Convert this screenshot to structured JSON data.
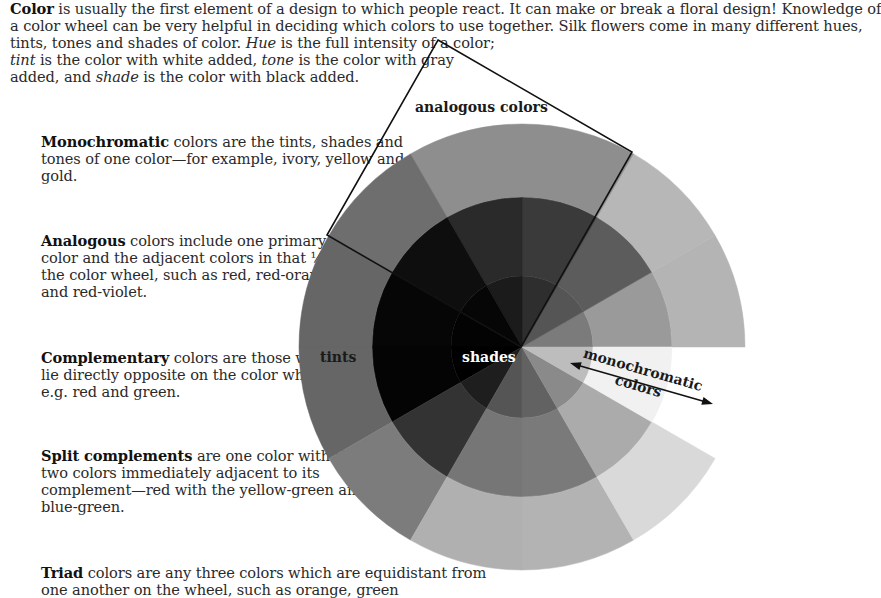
{
  "intro": {
    "lines": [
      [
        {
          "t": "Color",
          "s": "b"
        },
        {
          "t": " is usually the first element of a design to which people react. It can make or break a floral design! Knowledge of"
        }
      ],
      [
        {
          "t": "a color wheel can be very helpful in deciding which colors to use together. Silk flowers come in many different hues,"
        }
      ],
      [
        {
          "t": "tints, tones and shades of color. "
        },
        {
          "t": "Hue",
          "s": "i"
        },
        {
          "t": " is the full intensity of a color;"
        }
      ],
      [
        {
          "t": "tint",
          "s": "i"
        },
        {
          "t": " is the color with white added, "
        },
        {
          "t": "tone",
          "s": "i"
        },
        {
          "t": " is the color with gray"
        }
      ],
      [
        {
          "t": "added, and "
        },
        {
          "t": "shade",
          "s": "i"
        },
        {
          "t": " is the color with black added."
        }
      ]
    ]
  },
  "blocks": [
    {
      "id": "monochromatic",
      "top": 133,
      "lines": [
        [
          {
            "t": "Monochromatic",
            "s": "b"
          },
          {
            "t": " colors are the tints, shades and"
          }
        ],
        [
          {
            "t": "tones of one color—for example, ivory, yellow and"
          }
        ],
        [
          {
            "t": "gold."
          }
        ]
      ]
    },
    {
      "id": "analogous",
      "top": 232,
      "lines": [
        [
          {
            "t": "Analogous",
            "s": "b"
          },
          {
            "t": " colors include one primary"
          }
        ],
        [
          {
            "t": "color and the adjacent colors in that ¼ of"
          }
        ],
        [
          {
            "t": "the color wheel, such as red, red-orange"
          }
        ],
        [
          {
            "t": "and red-violet."
          }
        ]
      ]
    },
    {
      "id": "complementary",
      "top": 349,
      "lines": [
        [
          {
            "t": "Complementary",
            "s": "b"
          },
          {
            "t": " colors are those which"
          }
        ],
        [
          {
            "t": "lie directly opposite on the color wheel,"
          }
        ],
        [
          {
            "t": "e.g. red and green."
          }
        ]
      ]
    },
    {
      "id": "split-complements",
      "top": 447,
      "lines": [
        [
          {
            "t": "Split complements",
            "s": "b"
          },
          {
            "t": " are one color with the"
          }
        ],
        [
          {
            "t": "two colors immediately adjacent to its"
          }
        ],
        [
          {
            "t": "complement—red with the yellow-green and"
          }
        ],
        [
          {
            "t": "blue-green."
          }
        ]
      ]
    },
    {
      "id": "triad",
      "top": 564,
      "lines": [
        [
          {
            "t": "Triad",
            "s": "b"
          },
          {
            "t": " colors are any three colors which are equidistant from"
          }
        ],
        [
          {
            "t": "one another on the wheel, such as orange, green"
          }
        ]
      ]
    }
  ],
  "wheel": {
    "center": [
      522,
      347
    ],
    "radii": {
      "inner": 71,
      "middle": 150,
      "outer": 223
    },
    "sector_degrees": 30,
    "sectors": [
      {
        "from": 0,
        "to": 30,
        "inner": "#7b7b7b",
        "middle": "#9a9a9a",
        "outer": "#b4b4b4"
      },
      {
        "from": 30,
        "to": 60,
        "inner": "#555555",
        "middle": "#5c5c5c",
        "outer": "#b7b7b7"
      },
      {
        "from": 60,
        "to": 90,
        "inner": "#2e2e2e",
        "middle": "#3a3a3a",
        "outer": "#8e8e8e"
      },
      {
        "from": 90,
        "to": 120,
        "inner": "#1b1b1b",
        "middle": "#2a2a2a",
        "outer": "#8e8e8e"
      },
      {
        "from": 120,
        "to": 150,
        "inner": "#060606",
        "middle": "#0e0e0e",
        "outer": "#6e6e6e"
      },
      {
        "from": 150,
        "to": 180,
        "inner": "#030303",
        "middle": "#060606",
        "outer": "#666666"
      },
      {
        "from": 180,
        "to": 210,
        "inner": "#000000",
        "middle": "#040404",
        "outer": "#666666"
      },
      {
        "from": 210,
        "to": 240,
        "inner": "#1e1e1e",
        "middle": "#333333",
        "outer": "#7c7c7c"
      },
      {
        "from": 240,
        "to": 270,
        "inner": "#555555",
        "middle": "#767676",
        "outer": "#b0b0b0"
      },
      {
        "from": 270,
        "to": 300,
        "inner": "#626262",
        "middle": "#7a7a7a",
        "outer": "#b3b3b3"
      },
      {
        "from": 300,
        "to": 330,
        "inner": "#8a8a8a",
        "middle": "#ababab",
        "outer": "#d9d9d9"
      },
      {
        "from": 330,
        "to": 360,
        "inner": "#bdbdbd",
        "middle": "#f1f1f1",
        "outer": null
      }
    ],
    "labels": {
      "tints": "tints",
      "shades": "shades",
      "analogous": "analogous colors",
      "monochromatic_line1": "monochromatic",
      "monochromatic_line2": "colors"
    },
    "analogous_box": [
      [
        438,
        40
      ],
      [
        632,
        152
      ],
      [
        521,
        347
      ],
      [
        327,
        235
      ]
    ],
    "monochromatic_arrow": {
      "from": [
        570,
        363
      ],
      "to": [
        713,
        404
      ]
    }
  }
}
